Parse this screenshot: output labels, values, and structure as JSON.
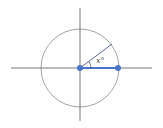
{
  "diagram": {
    "type": "unit-circle-angle",
    "angle_label": "x°",
    "colors": {
      "axes": "#555555",
      "circle": "#666666",
      "radius_line": "#4a5a8a",
      "highlight": "#4a74c9"
    }
  }
}
